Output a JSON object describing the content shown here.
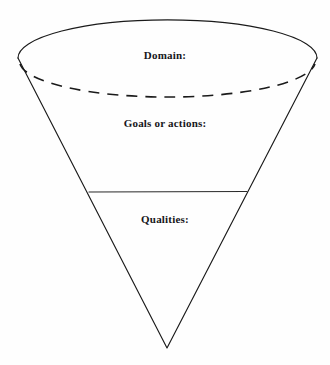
{
  "figure": {
    "kind": "inverted-cone-diagram",
    "background_color": "#fefefe",
    "stroke_color": "#1a1a1a"
  },
  "labels": {
    "domain": "Domain:",
    "goals_or_actions": "Goals or actions:",
    "qualities": "Qualities:"
  },
  "geometry": {
    "ellipse": {
      "cx": 167,
      "cy": 58,
      "rx": 149,
      "ry": 38,
      "front_arc_style": "dashed",
      "back_arc_style": "solid"
    },
    "apex": {
      "x": 167,
      "y": 348
    },
    "left_rim": {
      "x": 18,
      "y": 60
    },
    "right_rim": {
      "x": 317,
      "y": 60
    },
    "divider_line": {
      "x1": 89,
      "y1": 192,
      "x2": 247,
      "y2": 192
    }
  }
}
